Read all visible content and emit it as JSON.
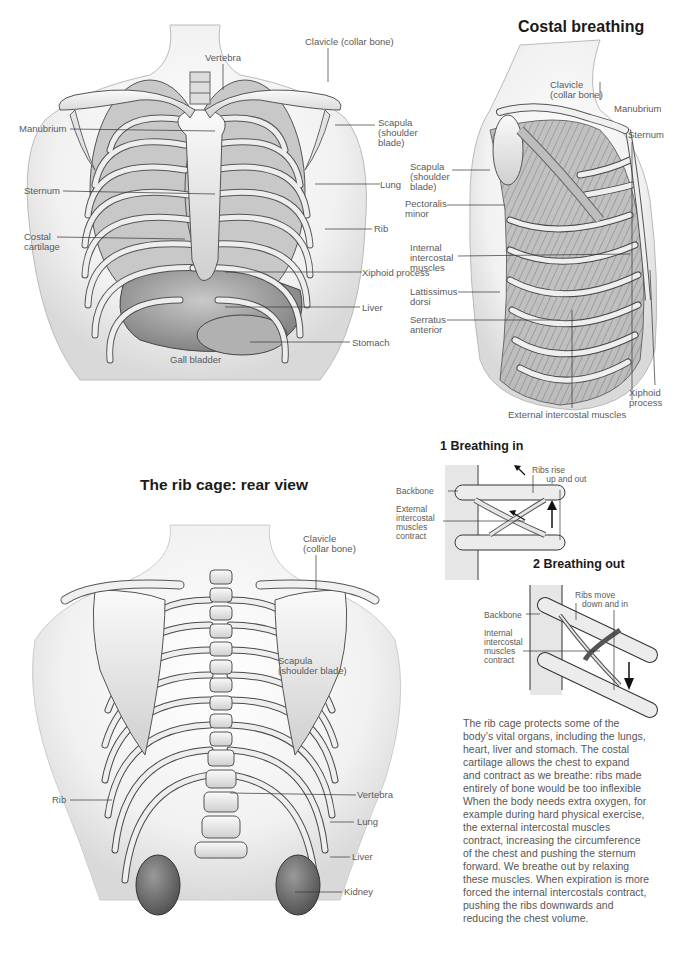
{
  "titles": {
    "costal_breathing": "Costal breathing",
    "rear_view": "The rib cage: rear view",
    "breathing_in": "1 Breathing in",
    "breathing_out": "2 Breathing out"
  },
  "front_view": {
    "labels": {
      "vertebra": "Vertebra",
      "clavicle": "Clavicle (collar bone)",
      "manubrium": "Manubrium",
      "scapula": "Scapula\n(shoulder\nblade)",
      "sternum": "Sternum",
      "lung": "Lung",
      "costal_cartilage": "Costal\ncartilage",
      "rib": "Rib",
      "xiphoid_process": "Xiphoid process",
      "liver": "Liver",
      "stomach": "Stomach",
      "gall_bladder": "Gall bladder"
    }
  },
  "side_view": {
    "labels": {
      "clavicle": "Clavicle\n(collar bone)",
      "manubrium": "Manubrium",
      "sternum": "Sternum",
      "scapula": "Scapula\n(shoulder\nblade)",
      "pectoralis_minor": "Pectoralis\nminor",
      "internal_intercostal": "Internal\nintercostal\nmuscles",
      "lattissimus_dorsi": "Lattissimus\ndorsi",
      "serratus_anterior": "Serratus\nanterior",
      "xiphoid_process": "Xiphoid\nprocess",
      "external_intercostal": "External intercostal muscles"
    }
  },
  "breathing_in": {
    "labels": {
      "ribs_rise": "Ribs rise\n      up and out",
      "backbone": "Backbone",
      "external_intercostal": "External\nintercostal\nmuscles\ncontract"
    },
    "arrow": "up"
  },
  "breathing_out": {
    "labels": {
      "ribs_move": "Ribs move\n   down and in",
      "backbone": "Backbone",
      "internal_intercostal": "Internal\nintercostal\nmuscles\ncontract"
    },
    "arrow": "down"
  },
  "rear_view": {
    "labels": {
      "clavicle": "Clavicle\n(collar bone)",
      "scapula": "Scapula\n(shoulder blade)",
      "rib": "Rib",
      "vertebra": "Vertebra",
      "lung": "Lung",
      "liver": "Liver",
      "kidney": "Kidney"
    }
  },
  "body_text": {
    "lines": [
      "The rib cage protects some of the",
      "body’s vital organs, including the lungs,",
      "heart, liver and stomach. The costal",
      "cartilage allows the chest to expand",
      "and contract as we breathe: ribs made",
      "entirely of bone would be too inflexible",
      "When the body needs extra oxygen, for",
      "example during hard physical exercise,",
      "the external intercostal muscles",
      "contract, increasing the circumference",
      "of the chest and pushing the sternum",
      "forward. We breathe out by relaxing",
      "these muscles. When expiration is more",
      "forced the internal intercostals contract,",
      "pushing the ribs downwards and",
      "reducing the chest volume."
    ]
  },
  "colors": {
    "bone": "#efefef",
    "outline": "#4a4a4a",
    "organ": "#9a9a9a",
    "skin_shadow": "#d8d8d8",
    "label": "#5a5a5a",
    "title": "#1a1a1a"
  }
}
